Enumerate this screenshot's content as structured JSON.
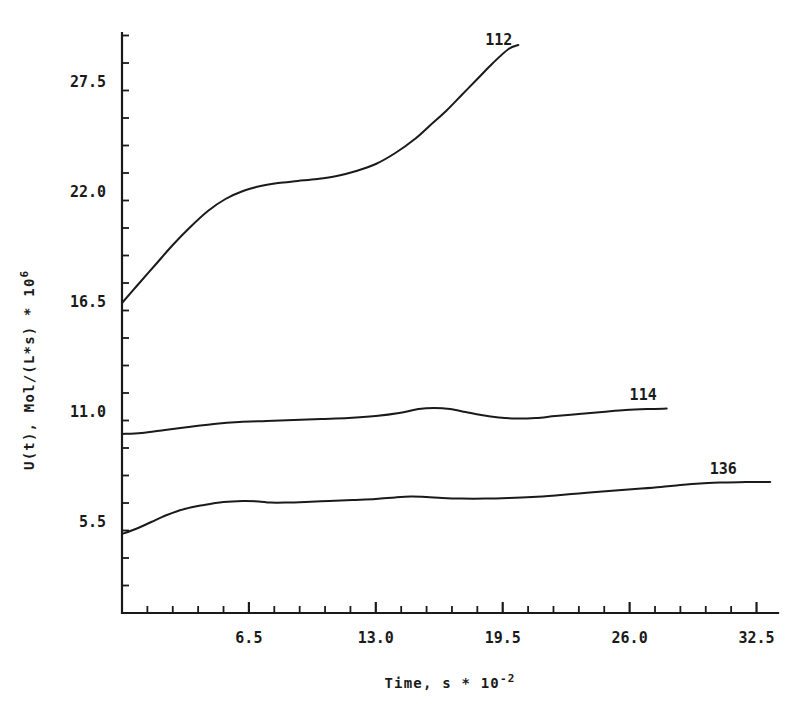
{
  "chart_data": {
    "type": "line",
    "title": "",
    "xlabel": "Time, s * 10^-2",
    "xlabel_base": "Time, s * 10",
    "xlabel_exp": "-2",
    "ylabel": "U(t), Mol/(L*s) * 10^6",
    "ylabel_base": "U(t), Mol/(L*s) * 10",
    "ylabel_exp": "6",
    "xlim": [
      0.0,
      33.6
    ],
    "ylim": [
      0.9,
      29.9
    ],
    "grid": false,
    "legend_position": "inline-end-of-curve",
    "xticks": [
      6.5,
      13.0,
      19.5,
      26.0,
      32.5
    ],
    "xtick_labels": [
      "6.5",
      "13.0",
      "19.5",
      "26.0",
      "32.5"
    ],
    "xtick_minor_step": 1.3,
    "yticks": [
      5.5,
      11.0,
      16.5,
      22.0,
      27.5
    ],
    "ytick_labels": [
      "5.5",
      "11.0",
      "16.5",
      "22.0",
      "27.5"
    ],
    "ytick_minor_step": 1.375,
    "series": [
      {
        "name": "112",
        "label": "112",
        "label_x": 18.6,
        "label_y": 29.3,
        "x": [
          0.0,
          0.8,
          1.7,
          2.6,
          3.5,
          4.4,
          5.3,
          6.2,
          7.1,
          8.0,
          9.0,
          10.0,
          11.0,
          12.0,
          13.0,
          14.0,
          15.0,
          15.8,
          16.6,
          17.4,
          18.2,
          19.0,
          19.8,
          20.3
        ],
        "y": [
          16.4,
          17.3,
          18.3,
          19.3,
          20.2,
          21.0,
          21.6,
          22.0,
          22.25,
          22.4,
          22.5,
          22.6,
          22.75,
          23.0,
          23.35,
          23.9,
          24.6,
          25.3,
          26.0,
          26.8,
          27.6,
          28.4,
          29.1,
          29.3
        ]
      },
      {
        "name": "114",
        "label": "114",
        "label_x": 26.0,
        "label_y": 11.55,
        "x": [
          0.0,
          1.0,
          2.2,
          3.4,
          4.7,
          6.0,
          7.4,
          8.8,
          10.2,
          11.6,
          13.0,
          14.2,
          15.2,
          16.0,
          16.8,
          17.6,
          18.4,
          19.3,
          20.2,
          21.2,
          22.2,
          23.4,
          24.6,
          25.8,
          27.0,
          27.9
        ],
        "y": [
          9.85,
          9.9,
          10.05,
          10.2,
          10.35,
          10.45,
          10.5,
          10.55,
          10.6,
          10.65,
          10.75,
          10.9,
          11.1,
          11.15,
          11.1,
          10.95,
          10.8,
          10.68,
          10.62,
          10.65,
          10.75,
          10.85,
          10.95,
          11.05,
          11.1,
          11.12
        ]
      },
      {
        "name": "136",
        "label": "136",
        "label_x": 30.1,
        "label_y": 7.85,
        "x": [
          0.0,
          0.7,
          1.5,
          2.3,
          3.2,
          4.2,
          5.2,
          6.2,
          7.0,
          7.6,
          8.4,
          9.4,
          10.6,
          11.8,
          13.0,
          14.0,
          14.8,
          15.6,
          16.4,
          17.4,
          18.6,
          19.8,
          21.0,
          22.2,
          23.4,
          24.6,
          25.6,
          26.6,
          27.6,
          28.6,
          29.6,
          30.6,
          31.6,
          32.6,
          33.2
        ],
        "y": [
          4.85,
          5.1,
          5.45,
          5.8,
          6.1,
          6.3,
          6.45,
          6.5,
          6.48,
          6.42,
          6.42,
          6.45,
          6.5,
          6.55,
          6.6,
          6.68,
          6.72,
          6.7,
          6.65,
          6.62,
          6.62,
          6.65,
          6.7,
          6.78,
          6.88,
          6.98,
          7.05,
          7.12,
          7.2,
          7.3,
          7.38,
          7.42,
          7.44,
          7.45,
          7.45
        ]
      }
    ]
  }
}
